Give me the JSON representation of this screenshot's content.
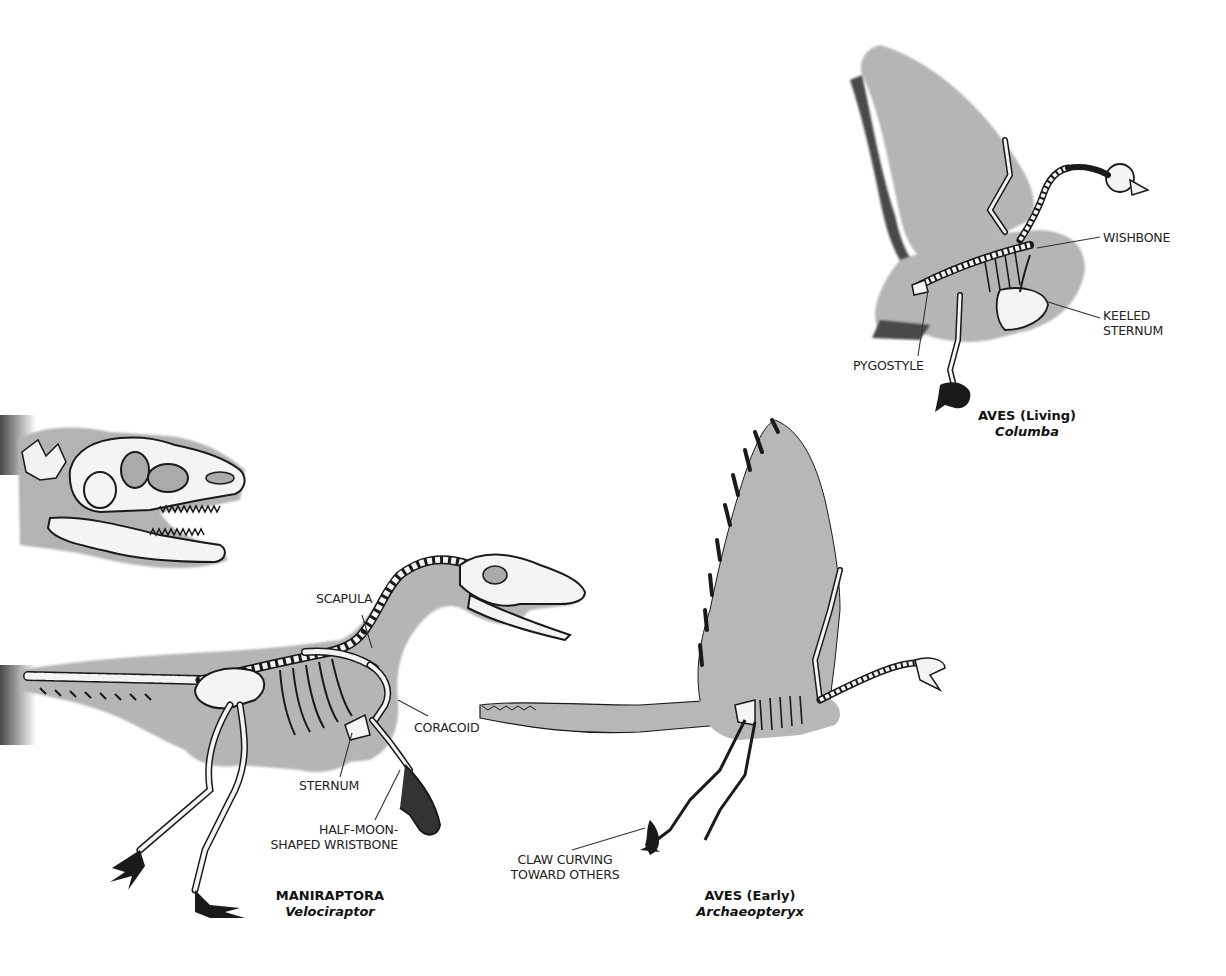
{
  "figure": {
    "title_visible": false,
    "background": "#ffffff",
    "fill_gray": "#b5b5b5",
    "shadow_gray": "#5a5a5a",
    "bone_fill": "#f4f4f4",
    "outline": "#1a1a1a"
  },
  "specimens": [
    {
      "id": "velociraptor",
      "group": "MANIRAPTORA",
      "genus": "Velociraptor",
      "labels": [
        {
          "text": "SCAPULA"
        },
        {
          "text": "CORACOID"
        },
        {
          "text": "STERNUM"
        },
        {
          "text_line1": "HALF-MOON-",
          "text_line2": "SHAPED WRISTBONE"
        }
      ]
    },
    {
      "id": "archaeopteryx",
      "group": "AVES (Early)",
      "genus": "Archaeopteryx",
      "labels": [
        {
          "text_line1": "CLAW CURVING",
          "text_line2": "TOWARD OTHERS"
        }
      ]
    },
    {
      "id": "columba",
      "group": "AVES (Living)",
      "genus": "Columba",
      "labels": [
        {
          "text": "WISHBONE"
        },
        {
          "text_line1": "KEELED",
          "text_line2": "STERNUM"
        },
        {
          "text": "PYGOSTYLE"
        }
      ]
    }
  ],
  "partial_skull": {
    "description": "theropod-skull-partial"
  }
}
